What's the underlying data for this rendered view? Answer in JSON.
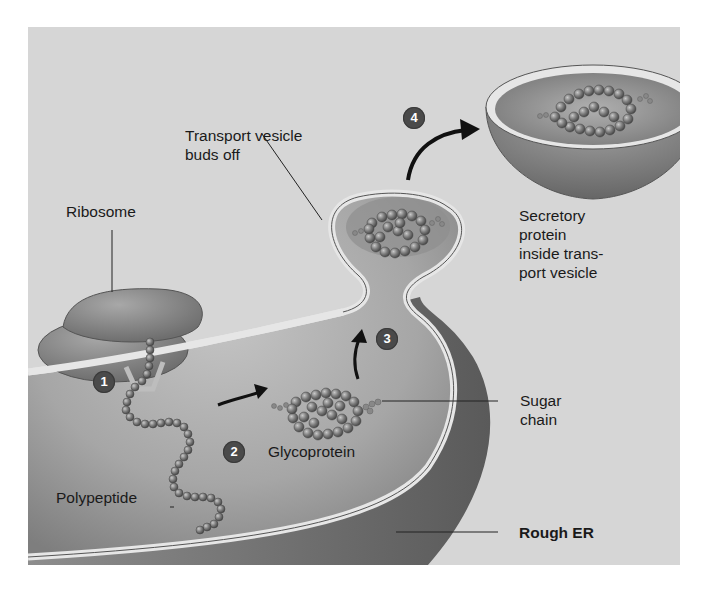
{
  "figure": {
    "background_color": "#d6d6d6",
    "membrane_color": "#8a8a8a",
    "lumen_color": "#a9a9a9",
    "step_badge_color": "#4a4a4a"
  },
  "labels": {
    "transport_vesicle": [
      "Transport vesicle",
      "buds off"
    ],
    "ribosome": "Ribosome",
    "secretory_protein": [
      "Secretory",
      "protein",
      "inside trans-",
      "port vesicle"
    ],
    "sugar_chain": [
      "Sugar",
      "chain"
    ],
    "glycoprotein": "Glycoprotein",
    "polypeptide": "Polypeptide",
    "rough_er": "Rough ER"
  },
  "steps": [
    {
      "number": "1",
      "description": "polypeptide enters ER through ribosome"
    },
    {
      "number": "2",
      "description": "polypeptide becomes glycoprotein"
    },
    {
      "number": "3",
      "description": "glycoprotein moves into bud"
    },
    {
      "number": "4",
      "description": "transport vesicle buds off"
    }
  ]
}
